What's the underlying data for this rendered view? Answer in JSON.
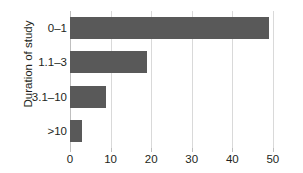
{
  "chart_data": {
    "type": "bar",
    "orientation": "horizontal",
    "title": "",
    "xlabel": "",
    "ylabel": "Duration of study",
    "categories": [
      "0–1",
      "1.1–3",
      "3.1–10",
      ">10"
    ],
    "values": [
      49,
      19,
      8.8,
      2.9
    ],
    "xlim": [
      0,
      52
    ],
    "ylim": null,
    "xticks": [
      0,
      10,
      20,
      30,
      40,
      50
    ],
    "xtick_labels": [
      "0",
      "10",
      "20",
      "30",
      "40",
      "50"
    ],
    "grid": "vertical",
    "legend": null,
    "colors": {
      "bar": "#595959",
      "gridline": "#d9d9d9",
      "axis": "#bfbfbf",
      "text": "#231f20",
      "background": "#ffffff"
    }
  }
}
